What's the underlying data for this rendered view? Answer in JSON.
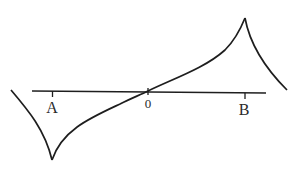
{
  "diagram": {
    "axis": {
      "color": "#1e1e1e",
      "ticks": [
        {
          "label": "A",
          "x": 52
        },
        {
          "label": "0",
          "x": 148
        },
        {
          "label": "B",
          "x": 245
        }
      ]
    },
    "labels": {
      "A": "A",
      "origin": "0",
      "B": "B"
    },
    "curve": {
      "description": "Curve with a cusp minimum below point A and a cusp maximum above point B, passing through origin 0",
      "color": "#1e1e1e"
    }
  }
}
